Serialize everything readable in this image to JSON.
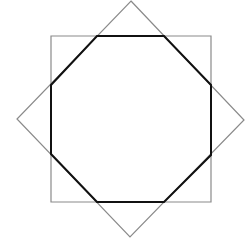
{
  "canvas": {
    "width": 246,
    "height": 240,
    "background": "#ffffff"
  },
  "shapes": {
    "square": {
      "points": "51,36 211,36 211,202 51,202",
      "stroke": "#8a8a8a",
      "stroke_width": 1.2
    },
    "diamond": {
      "points": "131,1 244,120 130,237 17,119",
      "stroke": "#8a8a8a",
      "stroke_width": 1.2
    },
    "octagon": {
      "points": "97,36 164,36 211,85 211,155 164,202 97,202 51,154 51,85",
      "stroke": "#111111",
      "stroke_width": 2
    }
  }
}
